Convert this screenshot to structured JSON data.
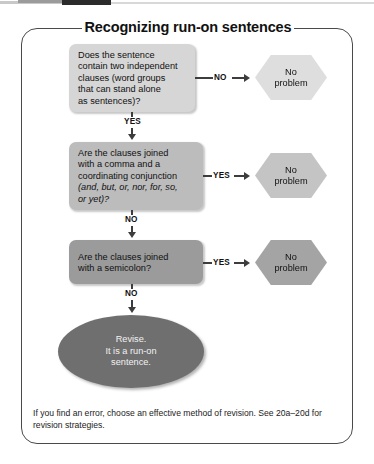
{
  "chart_title": "Recognizing run-on sentences",
  "nodes": {
    "q1": {
      "lines": [
        "Does the sentence",
        "contain two independent",
        "clauses (word groups",
        "that can stand alone",
        "as sentences)?"
      ],
      "fill": "#d6d6d6"
    },
    "q2": {
      "lines": [
        "Are the clauses joined",
        "with a comma and a",
        "coordinating conjunction"
      ],
      "italic_lines": [
        "(and, but, or, nor, for, so,",
        "or yet)?"
      ],
      "fill": "#bcbcbc"
    },
    "q3": {
      "lines": [
        "Are the clauses joined",
        "with a semicolon?"
      ],
      "fill": "#9b9b9b"
    },
    "out1": {
      "line1": "No",
      "line2": "problem",
      "fill": "#dedede"
    },
    "out2": {
      "line1": "No",
      "line2": "problem",
      "fill": "#c4c4c4"
    },
    "out3": {
      "line1": "No",
      "line2": "problem",
      "fill": "#a4a4a4"
    },
    "result": {
      "line1": "Revise.",
      "line2": "It is a run-on",
      "line3": "sentence.",
      "fill": "#6f6f6f"
    }
  },
  "edges": {
    "q1_no": "NO",
    "q1_yes": "YES",
    "q2_yes": "YES",
    "q2_no": "NO",
    "q3_yes": "YES",
    "q3_no": "NO"
  },
  "footer": {
    "line1": "If you find an error, choose an effective method of revision. See 20a–20d for",
    "line2": "revision strategies."
  },
  "colors": {
    "frame_border": "#4a4a4a",
    "connector": "#3d3d3d",
    "text": "#111111"
  }
}
